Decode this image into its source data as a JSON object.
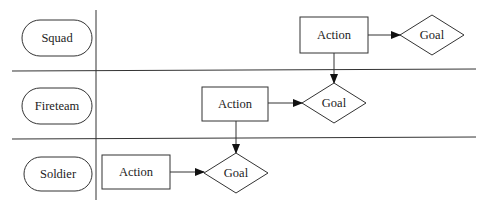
{
  "lanes": [
    {
      "label": "Squad",
      "action": "Action",
      "goal": "Goal"
    },
    {
      "label": "Fireteam",
      "action": "Action",
      "goal": "Goal"
    },
    {
      "label": "Soldier",
      "action": "Action",
      "goal": "Goal"
    }
  ],
  "colors": {
    "stroke": "#333333",
    "background": "#ffffff",
    "text": "#222222"
  }
}
